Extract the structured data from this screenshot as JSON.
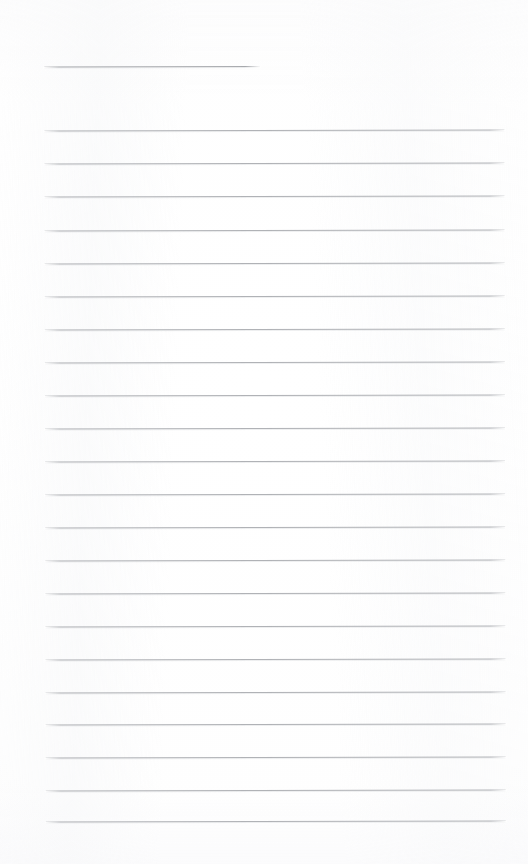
{
  "document": {
    "kind": "lined-notepad-page",
    "title_text": "",
    "body_text": "",
    "page_width": 528,
    "page_height": 864,
    "background_color": "#ffffff",
    "rule_color": "#b0b2b6",
    "header_rule_color": "#a7a9ad",
    "line_count_total": 23,
    "body_line_count": 22,
    "line_spacing_px": 33,
    "skew_degrees": -0.12
  },
  "header_rule": {
    "name": "title-rule",
    "x": 45,
    "y": 66,
    "width": 216,
    "thickness": 1
  },
  "body_rules": [
    {
      "index": 1,
      "x": 45,
      "y": 130,
      "width": 460
    },
    {
      "index": 2,
      "x": 45,
      "y": 163,
      "width": 460
    },
    {
      "index": 3,
      "x": 45,
      "y": 196,
      "width": 460
    },
    {
      "index": 4,
      "x": 45,
      "y": 230,
      "width": 460
    },
    {
      "index": 5,
      "x": 45,
      "y": 263,
      "width": 460
    },
    {
      "index": 6,
      "x": 45,
      "y": 296,
      "width": 460
    },
    {
      "index": 7,
      "x": 45,
      "y": 329,
      "width": 460
    },
    {
      "index": 8,
      "x": 45,
      "y": 362,
      "width": 460
    },
    {
      "index": 9,
      "x": 45,
      "y": 395,
      "width": 460
    },
    {
      "index": 10,
      "x": 45,
      "y": 428,
      "width": 460
    },
    {
      "index": 11,
      "x": 45,
      "y": 461,
      "width": 460
    },
    {
      "index": 12,
      "x": 45,
      "y": 494,
      "width": 460
    },
    {
      "index": 13,
      "x": 45,
      "y": 527,
      "width": 460
    },
    {
      "index": 14,
      "x": 45,
      "y": 560,
      "width": 460
    },
    {
      "index": 15,
      "x": 45,
      "y": 593,
      "width": 460
    },
    {
      "index": 16,
      "x": 45,
      "y": 626,
      "width": 460
    },
    {
      "index": 17,
      "x": 45,
      "y": 659,
      "width": 460
    },
    {
      "index": 18,
      "x": 45,
      "y": 692,
      "width": 460
    },
    {
      "index": 19,
      "x": 45,
      "y": 724,
      "width": 460
    },
    {
      "index": 20,
      "x": 45,
      "y": 757,
      "width": 460
    },
    {
      "index": 21,
      "x": 45,
      "y": 790,
      "width": 460
    },
    {
      "index": 22,
      "x": 45,
      "y": 821,
      "width": 460
    }
  ]
}
